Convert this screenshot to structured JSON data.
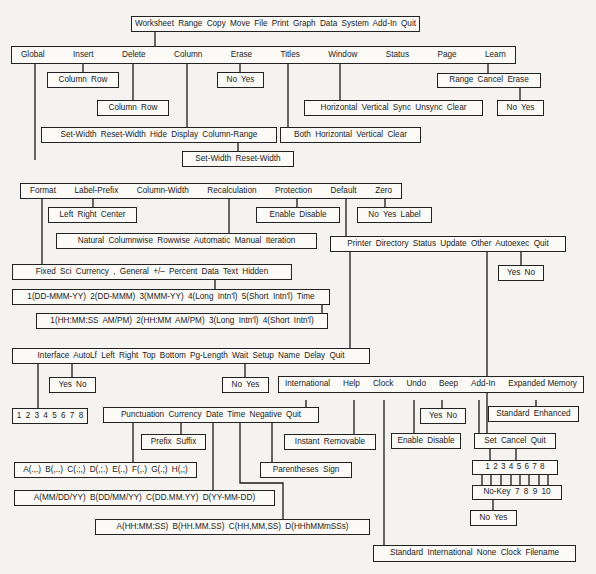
{
  "diagram": {
    "root": {
      "label": "Worksheet Range Copy Move File Print Graph Data System Add-In Quit"
    },
    "worksheet_menu": {
      "items": [
        "Global",
        "Insert",
        "Delete",
        "Column",
        "Erase",
        "Titles",
        "Window",
        "Status",
        "Page",
        "Learn"
      ]
    },
    "insert_sub": {
      "label": "Column Row"
    },
    "delete_sub": {
      "label": "Column Row"
    },
    "erase_sub": {
      "label": "No Yes"
    },
    "column_sub": {
      "label": "Set-Width Reset-Width Hide Display Column-Range"
    },
    "column_range_sub": {
      "label": "Set-Width Reset-Width"
    },
    "titles_sub": {
      "label": "Both Horizontal Vertical Clear"
    },
    "window_sub": {
      "label": "Horizontal Vertical Sync Unsync Clear"
    },
    "learn_sub": {
      "label": "Range Cancel Erase"
    },
    "learn_erase_sub": {
      "label": "No Yes"
    },
    "global_menu": {
      "items": [
        "Format",
        "Label-Prefix",
        "Column-Width",
        "Recalculation",
        "Protection",
        "Default",
        "Zero"
      ]
    },
    "label_prefix_sub": {
      "label": "Left Right Center"
    },
    "protection_sub": {
      "label": "Enable Disable"
    },
    "zero_sub": {
      "label": "No Yes Label"
    },
    "recalculation_sub": {
      "label": "Natural Columnwise Rowwise Automatic Manual Iteration"
    },
    "default_sub": {
      "label": "Printer Directory Status Update Other Autoexec Quit"
    },
    "autoexec_sub": {
      "label": "Yes No"
    },
    "format_sub": {
      "label": "Fixed Sci Currency , General +/– Percent Data Text Hidden"
    },
    "date_formats": {
      "label": "1(DD-MMM-YY) 2(DD-MMM) 3(MMM-YY) 4(Long Intn'l) 5(Short Intn'l) Time"
    },
    "time_formats": {
      "label": "1(HH:MM:SS AM/PM) 2(HH:MM AM/PM) 3(Long Intn'l) 4(Short Intn'l)"
    },
    "printer_sub": {
      "label": "Interface AutoLf Left Right Top Bottom Pg-Length Wait Setup Name Delay Quit"
    },
    "autolf_sub": {
      "label": "Yes No"
    },
    "interface_sub": {
      "label": "1 2 3 4 5 6 7 8"
    },
    "wait_sub": {
      "label": "No Yes"
    },
    "other_sub": {
      "items": [
        "International",
        "Help",
        "Clock",
        "Undo",
        "Beep",
        "Add-In",
        "Expanded Memory"
      ]
    },
    "international_sub": {
      "label": "Punctuation Currency Date Time Negative Quit"
    },
    "currency_sub": {
      "label": "Prefix Suffix"
    },
    "help_sub": {
      "label": "Instant Removable"
    },
    "beep_sub": {
      "label": "Yes No"
    },
    "undo_sub": {
      "label": "Enable Disable"
    },
    "expanded_memory_sub": {
      "label": "Standard Enhanced"
    },
    "addin_sub": {
      "label": "Set Cancel Quit"
    },
    "negative_sub": {
      "label": "Parentheses Sign"
    },
    "punctuation_sub": {
      "label": "A(.,.) B(,..) C(.;,) D(,;.) E(.,) F(,.) G(.;) H(,;)"
    },
    "date_intl_sub": {
      "label": "A(MM/DD/YY) B(DD/MM/YY) C(DD.MM.YY) D(YY-MM-DD)"
    },
    "time_intl_sub": {
      "label": "A(HH:MM:SS) B(HH.MM.SS) C(HH,MM,SS) D(HHhMMmSSs)"
    },
    "addin_set_sub": {
      "label": "1 2 3 4 5 6 7 8"
    },
    "addin_key_sub": {
      "label": "No-Key 7 8 9 10"
    },
    "addin_yesno_sub": {
      "label": "No Yes"
    },
    "clock_sub": {
      "label": "Standard International None Clock Filename"
    }
  }
}
